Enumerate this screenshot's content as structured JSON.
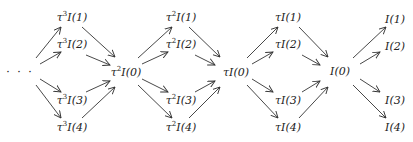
{
  "diagram": {
    "type": "commutative-diagram",
    "ellipsis": "· · ·",
    "nodes": [
      {
        "id": "t3I1",
        "tau": "τ",
        "exp": "3",
        "label": "I(1)",
        "x": 72,
        "y": 17
      },
      {
        "id": "t3I2",
        "tau": "τ",
        "exp": "3",
        "label": "I(2)",
        "x": 72,
        "y": 44
      },
      {
        "id": "t3I3",
        "tau": "τ",
        "exp": "3",
        "label": "I(3)",
        "x": 72,
        "y": 100
      },
      {
        "id": "t3I4",
        "tau": "τ",
        "exp": "3",
        "label": "I(4)",
        "x": 72,
        "y": 127
      },
      {
        "id": "t2I0",
        "tau": "τ",
        "exp": "2",
        "label": "I(0)",
        "x": 126,
        "y": 72
      },
      {
        "id": "t2I1",
        "tau": "τ",
        "exp": "2",
        "label": "I(1)",
        "x": 181,
        "y": 17
      },
      {
        "id": "t2I2",
        "tau": "τ",
        "exp": "2",
        "label": "I(2)",
        "x": 181,
        "y": 44
      },
      {
        "id": "t2I3",
        "tau": "τ",
        "exp": "2",
        "label": "I(3)",
        "x": 181,
        "y": 100
      },
      {
        "id": "t2I4",
        "tau": "τ",
        "exp": "2",
        "label": "I(4)",
        "x": 181,
        "y": 127
      },
      {
        "id": "tI0",
        "tau": "τ",
        "exp": "",
        "label": "I(0)",
        "x": 236,
        "y": 72
      },
      {
        "id": "tI1",
        "tau": "τ",
        "exp": "",
        "label": "I(1)",
        "x": 288,
        "y": 17
      },
      {
        "id": "tI2",
        "tau": "τ",
        "exp": "",
        "label": "I(2)",
        "x": 288,
        "y": 44
      },
      {
        "id": "tI3",
        "tau": "τ",
        "exp": "",
        "label": "I(3)",
        "x": 288,
        "y": 100
      },
      {
        "id": "tI4",
        "tau": "τ",
        "exp": "",
        "label": "I(4)",
        "x": 288,
        "y": 127
      },
      {
        "id": "I0",
        "tau": "",
        "exp": "",
        "label": "I(0)",
        "x": 340,
        "y": 71
      },
      {
        "id": "I1",
        "tau": "",
        "exp": "",
        "label": "I(1)",
        "x": 395,
        "y": 19
      },
      {
        "id": "I2",
        "tau": "",
        "exp": "",
        "label": "I(2)",
        "x": 395,
        "y": 46
      },
      {
        "id": "I3",
        "tau": "",
        "exp": "",
        "label": "I(3)",
        "x": 395,
        "y": 100
      },
      {
        "id": "I4",
        "tau": "",
        "exp": "",
        "label": "I(4)",
        "x": 395,
        "y": 127
      }
    ],
    "arrows": [
      [
        36,
        58,
        61,
        27
      ],
      [
        40,
        64,
        61,
        52
      ],
      [
        40,
        79,
        61,
        92
      ],
      [
        36,
        85,
        61,
        118
      ],
      [
        82,
        27,
        115,
        57
      ],
      [
        86,
        55,
        110,
        65
      ],
      [
        86,
        92,
        110,
        81
      ],
      [
        82,
        118,
        115,
        87
      ],
      [
        138,
        58,
        172,
        27
      ],
      [
        142,
        64,
        168,
        52
      ],
      [
        142,
        79,
        168,
        92
      ],
      [
        138,
        85,
        172,
        118
      ],
      [
        189,
        27,
        220,
        57
      ],
      [
        195,
        55,
        215,
        65
      ],
      [
        195,
        92,
        215,
        81
      ],
      [
        189,
        118,
        220,
        87
      ],
      [
        247,
        58,
        278,
        27
      ],
      [
        252,
        64,
        273,
        52
      ],
      [
        252,
        79,
        273,
        92
      ],
      [
        247,
        85,
        278,
        118
      ],
      [
        299,
        27,
        328,
        57
      ],
      [
        302,
        55,
        320,
        65
      ],
      [
        302,
        92,
        320,
        81
      ],
      [
        299,
        118,
        328,
        87
      ],
      [
        353,
        58,
        386,
        27
      ],
      [
        360,
        64,
        380,
        52
      ],
      [
        360,
        79,
        380,
        92
      ],
      [
        353,
        85,
        386,
        118
      ]
    ]
  }
}
